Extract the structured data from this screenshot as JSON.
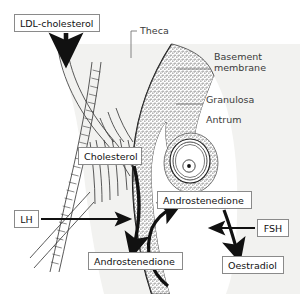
{
  "diagram": {
    "background_color": "#ffffff",
    "theca_fill": "#f2f2f0",
    "granulosa_fill": "#ffffff",
    "stipple_color": "#555555",
    "line_color": "#1a1a1a",
    "label_border_color": "#8a8a8a",
    "text_color": "#111111",
    "plain_text_color": "#3a3a3a"
  },
  "boxed_labels": [
    {
      "id": "ldl-cholesterol",
      "text": "LDL-cholesterol",
      "x": 14,
      "y": 14,
      "w": 86,
      "h": 18
    },
    {
      "id": "cholesterol",
      "text": "Cholesterol",
      "x": 78,
      "y": 147,
      "w": 64,
      "h": 18
    },
    {
      "id": "lh",
      "text": "LH",
      "x": 14,
      "y": 210,
      "w": 25,
      "h": 18
    },
    {
      "id": "androstenedione-theca",
      "text": "Androstenedione",
      "x": 88,
      "y": 252,
      "w": 95,
      "h": 18
    },
    {
      "id": "androstenedione-granulosa",
      "text": "Androstenedione",
      "x": 157,
      "y": 191,
      "w": 95,
      "h": 18
    },
    {
      "id": "fsh",
      "text": "FSH",
      "x": 257,
      "y": 219,
      "w": 32,
      "h": 18
    },
    {
      "id": "oestradiol",
      "text": "Oestradiol",
      "x": 222,
      "y": 256,
      "w": 62,
      "h": 18
    }
  ],
  "plain_labels": [
    {
      "id": "theca",
      "text": "Theca",
      "x": 140,
      "y": 30
    },
    {
      "id": "basement-membrane",
      "text": "Basement",
      "x": 214,
      "y": 56
    },
    {
      "id": "basement-membrane2",
      "text": "membrane",
      "x": 214,
      "y": 67
    },
    {
      "id": "granulosa",
      "text": "Granulosa",
      "x": 206,
      "y": 99
    },
    {
      "id": "antrum",
      "text": "Antrum",
      "x": 206,
      "y": 119
    }
  ],
  "structures": [
    {
      "id": "theca-layer",
      "name": "Theca interna / externa band"
    },
    {
      "id": "granulosa-layer",
      "name": "Granulosa cell layer (stippled)"
    },
    {
      "id": "basement-membrane-line",
      "name": "Basement membrane boundary"
    },
    {
      "id": "antrum-cavity",
      "name": "Antral cavity"
    },
    {
      "id": "oocyte",
      "name": "Oocyte with zona pellucida and nucleus"
    },
    {
      "id": "capillary",
      "name": "Theca capillary / blood vessels"
    }
  ],
  "arrows": [
    {
      "id": "arrow-ldl-to-theca",
      "from": "LDL-cholesterol",
      "to": "Theca",
      "style": "straight-down-thick"
    },
    {
      "id": "arrow-cholesterol-to-andro",
      "from": "Cholesterol",
      "to": "Androstenedione",
      "style": "curved-down-thick"
    },
    {
      "id": "arrow-lh-to-theca",
      "from": "LH",
      "to": "Theca cell",
      "style": "straight-right-thin"
    },
    {
      "id": "arrow-andro-to-granulosa",
      "from": "Androstenedione (theca)",
      "to": "Androstenedione (granulosa)",
      "style": "curved-up-thick"
    },
    {
      "id": "arrow-andro-to-oestradiol",
      "from": "Androstenedione (granulosa)",
      "to": "Oestradiol",
      "style": "curved-down-thick"
    },
    {
      "id": "arrow-fsh-to-granulosa",
      "from": "FSH",
      "to": "Granulosa cell",
      "style": "straight-left-thin"
    }
  ]
}
